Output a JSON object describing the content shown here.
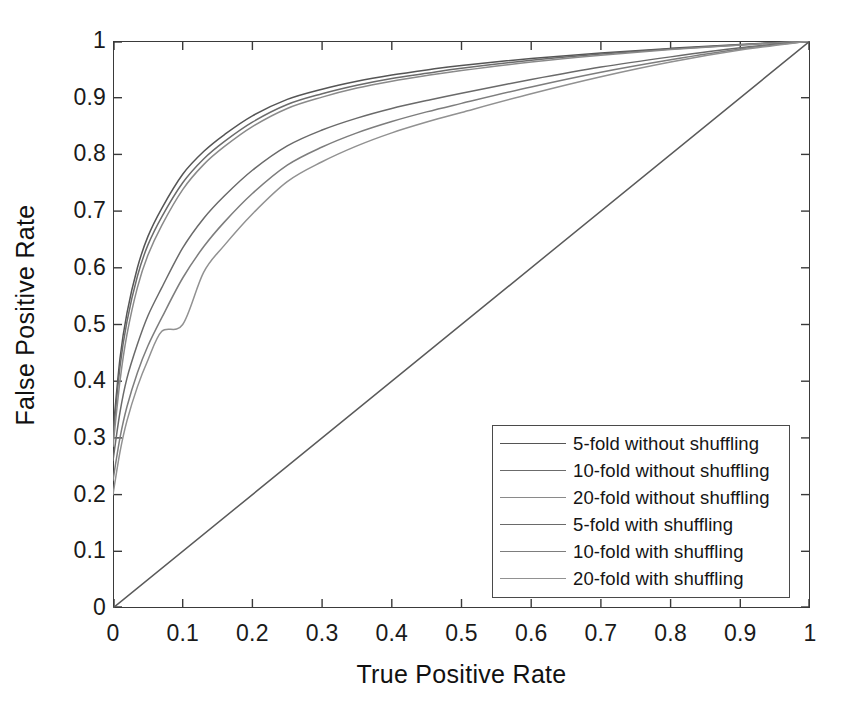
{
  "chart_data": {
    "type": "line",
    "title": "",
    "xlabel": "True Positive Rate",
    "ylabel": "False Positive Rate",
    "xlim": [
      0,
      1
    ],
    "ylim": [
      0,
      1
    ],
    "grid": false,
    "legend_position": "lower right",
    "xticks": [
      "0",
      "0.1",
      "0.2",
      "0.3",
      "0.4",
      "0.5",
      "0.6",
      "0.7",
      "0.8",
      "0.9",
      "1"
    ],
    "yticks": [
      "0",
      "0.1",
      "0.2",
      "0.3",
      "0.4",
      "0.5",
      "0.6",
      "0.7",
      "0.8",
      "0.9",
      "1"
    ],
    "xtick_values": [
      0,
      0.1,
      0.2,
      0.3,
      0.4,
      0.5,
      0.6,
      0.7,
      0.8,
      0.9,
      1
    ],
    "ytick_values": [
      0,
      0.1,
      0.2,
      0.3,
      0.4,
      0.5,
      0.6,
      0.7,
      0.8,
      0.9,
      1
    ],
    "series": [
      {
        "name": "5-fold without shuffling",
        "color": "#555555",
        "x": [
          0,
          0.01,
          0.02,
          0.035,
          0.05,
          0.07,
          0.1,
          0.13,
          0.16,
          0.2,
          0.25,
          0.3,
          0.35,
          0.4,
          0.45,
          0.5,
          0.6,
          0.7,
          0.8,
          0.9,
          1
        ],
        "y": [
          0.31,
          0.44,
          0.52,
          0.6,
          0.655,
          0.705,
          0.765,
          0.805,
          0.835,
          0.868,
          0.897,
          0.915,
          0.929,
          0.94,
          0.949,
          0.957,
          0.969,
          0.979,
          0.987,
          0.994,
          1
        ]
      },
      {
        "name": "10-fold without shuffling",
        "color": "#6b6b6b",
        "x": [
          0,
          0.01,
          0.02,
          0.035,
          0.05,
          0.07,
          0.1,
          0.13,
          0.16,
          0.2,
          0.25,
          0.3,
          0.35,
          0.4,
          0.45,
          0.5,
          0.6,
          0.7,
          0.8,
          0.9,
          1
        ],
        "y": [
          0.3,
          0.425,
          0.505,
          0.585,
          0.64,
          0.69,
          0.75,
          0.792,
          0.823,
          0.857,
          0.888,
          0.907,
          0.922,
          0.934,
          0.943,
          0.952,
          0.966,
          0.977,
          0.986,
          0.993,
          1
        ]
      },
      {
        "name": "20-fold without shuffling",
        "color": "#8a8a8a",
        "x": [
          0,
          0.01,
          0.02,
          0.035,
          0.05,
          0.07,
          0.1,
          0.13,
          0.16,
          0.2,
          0.25,
          0.3,
          0.35,
          0.4,
          0.45,
          0.5,
          0.6,
          0.7,
          0.8,
          0.9,
          1
        ],
        "y": [
          0.285,
          0.4,
          0.482,
          0.565,
          0.622,
          0.675,
          0.738,
          0.782,
          0.814,
          0.849,
          0.881,
          0.901,
          0.917,
          0.929,
          0.939,
          0.948,
          0.963,
          0.975,
          0.985,
          0.993,
          1
        ]
      },
      {
        "name": "5-fold with shuffling",
        "color": "#6a6a6a",
        "x": [
          0,
          0.01,
          0.02,
          0.035,
          0.05,
          0.07,
          0.1,
          0.13,
          0.16,
          0.2,
          0.25,
          0.3,
          0.35,
          0.4,
          0.45,
          0.5,
          0.6,
          0.7,
          0.8,
          0.9,
          1
        ],
        "y": [
          0.26,
          0.345,
          0.405,
          0.465,
          0.515,
          0.565,
          0.635,
          0.687,
          0.727,
          0.772,
          0.815,
          0.843,
          0.864,
          0.881,
          0.895,
          0.908,
          0.932,
          0.954,
          0.972,
          0.988,
          1
        ]
      },
      {
        "name": "10-fold with shuffling",
        "color": "#7d7d7d",
        "x": [
          0,
          0.01,
          0.02,
          0.035,
          0.05,
          0.07,
          0.1,
          0.13,
          0.16,
          0.2,
          0.25,
          0.3,
          0.35,
          0.4,
          0.45,
          0.5,
          0.6,
          0.7,
          0.8,
          0.9,
          1
        ],
        "y": [
          0.225,
          0.3,
          0.355,
          0.415,
          0.462,
          0.512,
          0.582,
          0.637,
          0.681,
          0.731,
          0.781,
          0.813,
          0.838,
          0.858,
          0.875,
          0.89,
          0.919,
          0.945,
          0.967,
          0.986,
          1
        ]
      },
      {
        "name": "20-fold with shuffling",
        "color": "#919191",
        "x": [
          0,
          0.01,
          0.02,
          0.035,
          0.05,
          0.07,
          0.1,
          0.13,
          0.16,
          0.2,
          0.25,
          0.3,
          0.35,
          0.4,
          0.45,
          0.5,
          0.6,
          0.7,
          0.8,
          0.9,
          1
        ],
        "y": [
          0.2,
          0.275,
          0.33,
          0.39,
          0.437,
          0.488,
          0.5,
          0.592,
          0.64,
          0.695,
          0.752,
          0.787,
          0.815,
          0.838,
          0.857,
          0.874,
          0.907,
          0.937,
          0.963,
          0.984,
          1
        ]
      },
      {
        "name": "reference-diagonal",
        "color": "#5a5a5a",
        "x": [
          0,
          1
        ],
        "y": [
          0,
          1
        ]
      }
    ]
  },
  "legend": {
    "entries": [
      {
        "label": "5-fold without shuffling",
        "color": "#555555"
      },
      {
        "label": "10-fold without shuffling",
        "color": "#6b6b6b"
      },
      {
        "label": "20-fold without shuffling",
        "color": "#8a8a8a"
      },
      {
        "label": "5-fold with shuffling",
        "color": "#6a6a6a"
      },
      {
        "label": "10-fold with shuffling",
        "color": "#7d7d7d"
      },
      {
        "label": "20-fold with shuffling",
        "color": "#919191"
      }
    ]
  },
  "axes": {
    "x_title": "True Positive Rate",
    "y_title": "False Positive Rate"
  }
}
